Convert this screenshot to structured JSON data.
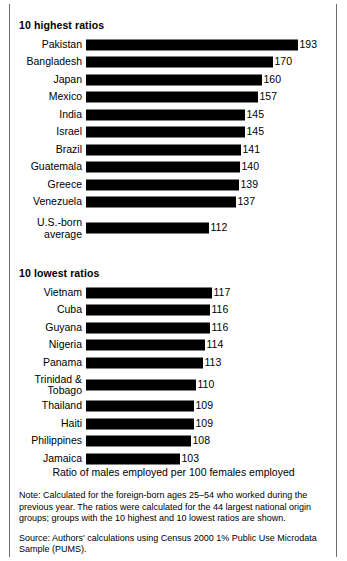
{
  "chart_data": {
    "type": "bar",
    "title": "",
    "xlabel": "Ratio of males employed per 100 females employed",
    "ylabel": "",
    "orientation": "horizontal",
    "grid": false,
    "legend": false,
    "sections": [
      {
        "heading": "10 highest ratios",
        "axis_min": 0,
        "axis_max": 193,
        "categories": [
          "Pakistan",
          "Bangladesh",
          "Japan",
          "Mexico",
          "India",
          "Israel",
          "Brazil",
          "Guatemala",
          "Greece",
          "Venezuela"
        ],
        "values": [
          193,
          170,
          160,
          157,
          145,
          145,
          141,
          140,
          139,
          137
        ]
      },
      {
        "heading": "",
        "axis_min": 0,
        "axis_max": 193,
        "categories": [
          "U.S.-born\naverage"
        ],
        "values": [
          112
        ]
      },
      {
        "heading": "10 lowest ratios",
        "axis_min": 0,
        "axis_max": 117,
        "categories": [
          "Vietnam",
          "Cuba",
          "Guyana",
          "Nigeria",
          "Panama",
          "Trinidad &\nTobago",
          "Thailand",
          "Haiti",
          "Philippines",
          "Jamaica"
        ],
        "values": [
          117,
          116,
          116,
          114,
          113,
          110,
          109,
          109,
          108,
          103
        ]
      }
    ]
  },
  "sections": {
    "highest": {
      "heading": "10 highest ratios",
      "rows": [
        {
          "label": "Pakistan",
          "value": "193",
          "bar_px": 212
        },
        {
          "label": "Bangladesh",
          "value": "170",
          "bar_px": 187
        },
        {
          "label": "Japan",
          "value": "160",
          "bar_px": 176
        },
        {
          "label": "Mexico",
          "value": "157",
          "bar_px": 172
        },
        {
          "label": "India",
          "value": "145",
          "bar_px": 159
        },
        {
          "label": "Israel",
          "value": "145",
          "bar_px": 159
        },
        {
          "label": "Brazil",
          "value": "141",
          "bar_px": 155
        },
        {
          "label": "Guatemala",
          "value": "140",
          "bar_px": 154
        },
        {
          "label": "Greece",
          "value": "139",
          "bar_px": 153
        },
        {
          "label": "Venezuela",
          "value": "137",
          "bar_px": 150
        }
      ]
    },
    "usborn": {
      "rows": [
        {
          "label": "U.S.-born\naverage",
          "value": "112",
          "bar_px": 123
        }
      ]
    },
    "lowest": {
      "heading": "10 lowest ratios",
      "rows": [
        {
          "label": "Vietnam",
          "value": "117",
          "bar_px": 126
        },
        {
          "label": "Cuba",
          "value": "116",
          "bar_px": 124
        },
        {
          "label": "Guyana",
          "value": "116",
          "bar_px": 124
        },
        {
          "label": "Nigeria",
          "value": "114",
          "bar_px": 119
        },
        {
          "label": "Panama",
          "value": "113",
          "bar_px": 117
        },
        {
          "label": "Trinidad &\nTobago",
          "value": "110",
          "bar_px": 110
        },
        {
          "label": "Thailand",
          "value": "109",
          "bar_px": 108
        },
        {
          "label": "Haiti",
          "value": "109",
          "bar_px": 108
        },
        {
          "label": "Philippines",
          "value": "108",
          "bar_px": 105
        },
        {
          "label": "Jamaica",
          "value": "103",
          "bar_px": 94
        }
      ]
    }
  },
  "axis_caption": "Ratio of males employed per 100 females employed",
  "footnotes": {
    "note": "Note: Calculated for the foreign-born ages 25–54 who worked during the previous year. The ratios were calculated for the 44 largest national origin groups; groups with the 10 highest and 10 lowest ratios are shown.",
    "source": "Source: Authors' calculations using Census 2000 1% Public Use Microdata Sample (PUMS)."
  }
}
